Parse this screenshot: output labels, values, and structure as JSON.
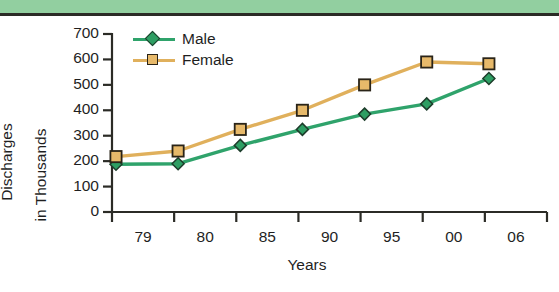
{
  "decor": {
    "band_color": "#92cfa0",
    "rule_color": "#2b2b26"
  },
  "chart_data": {
    "type": "line",
    "title": "",
    "xlabel": "Years",
    "ylabel": "Discharges in Thousands",
    "ylabel_line1": "Discharges",
    "ylabel_line2": "in Thousands",
    "categories": [
      "79",
      "80",
      "85",
      "90",
      "95",
      "00",
      "06"
    ],
    "yticks": [
      0,
      100,
      200,
      300,
      400,
      500,
      600,
      700
    ],
    "ylim": [
      0,
      700
    ],
    "grid": false,
    "legend_position": "top-left-inside",
    "series": [
      {
        "name": "Male",
        "color": "#2e9e63",
        "line_color": "#2fa36b",
        "marker": "diamond",
        "values": [
          188,
          190,
          262,
          325,
          385,
          425,
          525
        ]
      },
      {
        "name": "Female",
        "color": "#e7b96a",
        "line_color": "#e0b05c",
        "marker": "square",
        "values": [
          218,
          240,
          325,
          400,
          500,
          590,
          583
        ]
      }
    ]
  }
}
